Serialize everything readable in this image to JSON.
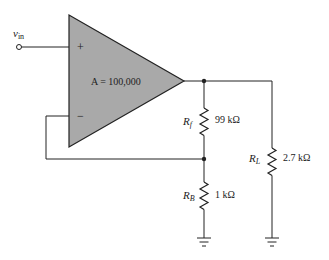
{
  "diagram": {
    "type": "non-inverting op-amp circuit",
    "input": {
      "label": "v",
      "subscript": "in"
    },
    "opamp": {
      "gain_label": "A = 100,000",
      "plus_sign": "+",
      "minus_sign": "−",
      "fill_color": "#a9a9a9"
    },
    "resistors": [
      {
        "id": "Rf",
        "symbol": "R",
        "subscript": "f",
        "value": "99 kΩ"
      },
      {
        "id": "RB",
        "symbol": "R",
        "subscript": "B",
        "value": "1 kΩ"
      },
      {
        "id": "RL",
        "symbol": "R",
        "subscript": "L",
        "value": "2.7 kΩ"
      }
    ],
    "grounds": 2,
    "wire_color": "#222222"
  }
}
